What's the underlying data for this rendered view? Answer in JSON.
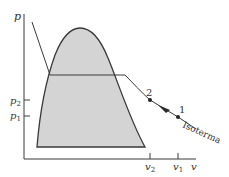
{
  "diagram": {
    "type": "p-v diagram",
    "axes": {
      "y_label": "p",
      "x_label": "v",
      "y_ticks": [
        {
          "label": "p",
          "sub": "2"
        },
        {
          "label": "p",
          "sub": "1"
        }
      ],
      "x_ticks": [
        {
          "label": "v",
          "sub": "2"
        },
        {
          "label": "v",
          "sub": "1"
        }
      ]
    },
    "states": [
      {
        "label": "2"
      },
      {
        "label": "1"
      }
    ],
    "curve_label": "Isoterma",
    "colors": {
      "dome_fill": "#d4d4d4",
      "line": "#3a3a3a",
      "background": "#ffffff"
    }
  }
}
